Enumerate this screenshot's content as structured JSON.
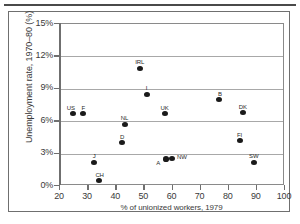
{
  "chart_data": {
    "type": "scatter",
    "title": "",
    "xlabel": "% of unionized workers, 1979",
    "ylabel": "Unemployment rate, 1970–80 (%)",
    "xlim": [
      20,
      100
    ],
    "ylim": [
      0,
      15
    ],
    "xticks": [
      "20",
      "30",
      "40",
      "50",
      "60",
      "70",
      "80",
      "90",
      "100"
    ],
    "xtick_values": [
      20,
      30,
      40,
      50,
      60,
      70,
      80,
      90,
      100
    ],
    "yticks": [
      "0%",
      "3%",
      "6%",
      "9%",
      "12%",
      "15%"
    ],
    "ytick_values": [
      0,
      3,
      6,
      9,
      12,
      15
    ],
    "grid": "horizontal",
    "legend": "none",
    "marker_color": "#1a1a1a",
    "grid_color": "#a8a8a8",
    "axis_color": "#6f6f6f",
    "points": [
      {
        "label": "US",
        "x": 24.5,
        "y": 6.7,
        "label_dx": -6,
        "label_dy": -9
      },
      {
        "label": "F",
        "x": 28.0,
        "y": 6.7,
        "label_dx": -1,
        "label_dy": -9
      },
      {
        "label": "J",
        "x": 32.0,
        "y": 2.2,
        "label_dx": -1,
        "label_dy": -9
      },
      {
        "label": "CH",
        "x": 34.0,
        "y": 0.5,
        "label_dx": -4,
        "label_dy": -9
      },
      {
        "label": "D",
        "x": 42.0,
        "y": 4.0,
        "label_dx": -2,
        "label_dy": -9
      },
      {
        "label": "NL",
        "x": 43.0,
        "y": 5.7,
        "label_dx": -4,
        "label_dy": -9
      },
      {
        "label": "IRL",
        "x": 48.5,
        "y": 10.9,
        "label_dx": -5,
        "label_dy": -9
      },
      {
        "label": "I",
        "x": 50.8,
        "y": 8.5,
        "label_dx": -1,
        "label_dy": -9
      },
      {
        "label": "UK",
        "x": 57.5,
        "y": 6.7,
        "label_dx": -5,
        "label_dy": -9
      },
      {
        "label": "A",
        "x": 57.8,
        "y": 2.5,
        "label_dx": -10,
        "label_dy": 1
      },
      {
        "label": "NW",
        "x": 59.8,
        "y": 2.55,
        "label_dx": 5,
        "label_dy": -4
      },
      {
        "label": "B",
        "x": 76.5,
        "y": 8.0,
        "label_dx": -1,
        "label_dy": -9
      },
      {
        "label": "FI",
        "x": 84.0,
        "y": 4.2,
        "label_dx": -3,
        "label_dy": -9
      },
      {
        "label": "DK",
        "x": 85.0,
        "y": 6.8,
        "label_dx": -4,
        "label_dy": -9
      },
      {
        "label": "SW",
        "x": 89.0,
        "y": 2.2,
        "label_dx": -5,
        "label_dy": -9
      }
    ]
  }
}
